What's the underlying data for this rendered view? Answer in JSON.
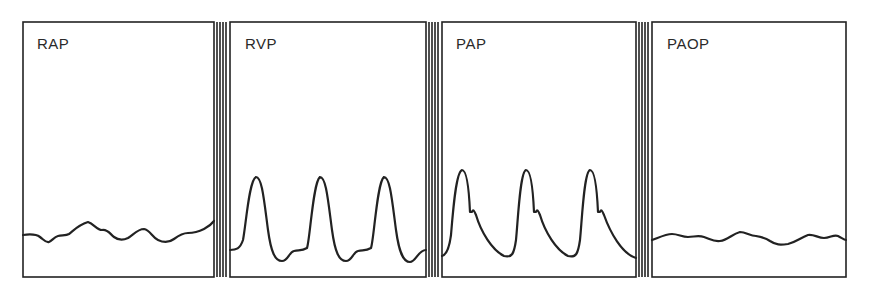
{
  "figure": {
    "line_color": "#222222",
    "background": "#ffffff",
    "panels": [
      {
        "id": "rap",
        "label": "RAP",
        "waveform": "low-amplitude undulating wave"
      },
      {
        "id": "rvp",
        "label": "RVP",
        "waveform": "three tall symmetric systolic peaks with low diastolic troughs"
      },
      {
        "id": "pap",
        "label": "PAP",
        "waveform": "three peaks with dicrotic notch and gradual diastolic decline"
      },
      {
        "id": "paop",
        "label": "PAOP",
        "waveform": "low-amplitude undulating wave"
      }
    ]
  }
}
